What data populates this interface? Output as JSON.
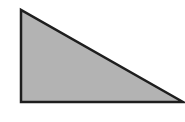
{
  "diagram": {
    "type": "right-triangle",
    "shape": {
      "vertices": [
        {
          "name": "top-left",
          "x": 21,
          "y": 10
        },
        {
          "name": "bottom-left",
          "x": 21,
          "y": 102
        },
        {
          "name": "bottom-right",
          "x": 183,
          "y": 102
        }
      ],
      "right_angle_at": "bottom-left"
    },
    "colors": {
      "fill": "#b3b3b3",
      "stroke": "#1e1e1e",
      "background": "#ffffff"
    },
    "stroke_width": 2.5
  }
}
